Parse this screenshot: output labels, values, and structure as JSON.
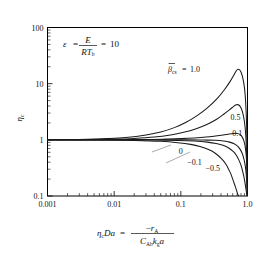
{
  "figure": {
    "annotation": {
      "epsilon_symbol": "ε",
      "equals": "=",
      "numerator": "E",
      "denominator_R": "R",
      "denominator_T": "T",
      "denominator_T_sub": "b",
      "value": "10",
      "full_text": "ε = E / (R T_b) = 10"
    },
    "ylabel": {
      "symbol": "η",
      "sub": "c"
    },
    "xlabel": {
      "lhs_eta": "η",
      "lhs_eta_sub": "c",
      "lhs_Da": "Da",
      "equals": "=",
      "numerator_minus": "−",
      "numerator_r": "r",
      "numerator_r_sub": "A",
      "den_C": "C",
      "den_C_sub": "Ab",
      "den_k": "k",
      "den_k_sub": "g",
      "den_a": "a",
      "full_text": "η_c Da = −r_A / (C_Ab k_g a)"
    },
    "legend_prefix": {
      "beta": "β",
      "sub": "cs",
      "equals": "="
    }
  },
  "chart_data": {
    "type": "line",
    "title": "",
    "xlabel": "η_c Da = −r_A / (C_Ab k_g a)",
    "ylabel": "η_c",
    "xscale": "log",
    "yscale": "log",
    "xlim": [
      0.001,
      1.0
    ],
    "ylim": [
      0.1,
      100
    ],
    "xticks": [
      0.001,
      0.01,
      0.1,
      1.0
    ],
    "xticklabels": [
      "0.001",
      "0.01",
      "0.1",
      "1.0"
    ],
    "yticks": [
      0.1,
      1,
      10,
      100
    ],
    "yticklabels": [
      "0.1",
      "1",
      "10",
      "100"
    ],
    "grid": false,
    "legend_position": "inline-curve-labels",
    "annotations": [
      {
        "text": "ε = E/(RT_b) = 10",
        "x": 0.008,
        "y": 38
      }
    ],
    "parameter_name": "β̄_cs",
    "series": [
      {
        "name": "1.0",
        "label": "β̄_cs = 1.0",
        "label_x": 0.12,
        "label_y": 13,
        "points": [
          [
            0.001,
            1.0
          ],
          [
            0.002,
            1.01
          ],
          [
            0.004,
            1.02
          ],
          [
            0.008,
            1.05
          ],
          [
            0.015,
            1.1
          ],
          [
            0.03,
            1.22
          ],
          [
            0.05,
            1.38
          ],
          [
            0.08,
            1.65
          ],
          [
            0.12,
            2.05
          ],
          [
            0.18,
            2.75
          ],
          [
            0.25,
            3.7
          ],
          [
            0.35,
            5.4
          ],
          [
            0.45,
            7.8
          ],
          [
            0.55,
            11.0
          ],
          [
            0.62,
            14.0
          ],
          [
            0.68,
            17.0
          ],
          [
            0.72,
            18.0
          ],
          [
            0.78,
            17.0
          ],
          [
            0.84,
            13.5
          ],
          [
            0.9,
            8.5
          ],
          [
            0.94,
            4.5
          ],
          [
            0.97,
            1.8
          ],
          [
            0.99,
            0.5
          ],
          [
            0.998,
            0.12
          ]
        ]
      },
      {
        "name": "0.5",
        "label": "0.5",
        "label_x": 0.66,
        "label_y": 2.6,
        "points": [
          [
            0.001,
            1.0
          ],
          [
            0.004,
            1.01
          ],
          [
            0.01,
            1.03
          ],
          [
            0.02,
            1.06
          ],
          [
            0.04,
            1.12
          ],
          [
            0.07,
            1.22
          ],
          [
            0.11,
            1.36
          ],
          [
            0.17,
            1.58
          ],
          [
            0.25,
            1.9
          ],
          [
            0.34,
            2.3
          ],
          [
            0.44,
            2.85
          ],
          [
            0.54,
            3.45
          ],
          [
            0.62,
            3.95
          ],
          [
            0.68,
            4.2
          ],
          [
            0.73,
            4.2
          ],
          [
            0.79,
            3.8
          ],
          [
            0.85,
            3.0
          ],
          [
            0.9,
            2.1
          ],
          [
            0.94,
            1.25
          ],
          [
            0.97,
            0.55
          ],
          [
            0.99,
            0.2
          ],
          [
            0.998,
            0.1
          ]
        ]
      },
      {
        "name": "0.1",
        "label": "0.1",
        "label_x": 0.7,
        "label_y": 1.3,
        "points": [
          [
            0.001,
            1.0
          ],
          [
            0.01,
            1.0
          ],
          [
            0.03,
            1.01
          ],
          [
            0.06,
            1.03
          ],
          [
            0.1,
            1.05
          ],
          [
            0.16,
            1.08
          ],
          [
            0.24,
            1.12
          ],
          [
            0.33,
            1.17
          ],
          [
            0.43,
            1.22
          ],
          [
            0.53,
            1.27
          ],
          [
            0.62,
            1.3
          ],
          [
            0.7,
            1.3
          ],
          [
            0.77,
            1.25
          ],
          [
            0.83,
            1.13
          ],
          [
            0.88,
            0.97
          ],
          [
            0.92,
            0.78
          ],
          [
            0.95,
            0.57
          ],
          [
            0.975,
            0.36
          ],
          [
            0.99,
            0.18
          ],
          [
            0.998,
            0.1
          ]
        ]
      },
      {
        "name": "0",
        "label": "0",
        "label_x": 0.1,
        "label_y": 0.62,
        "points": [
          [
            0.001,
            1.0
          ],
          [
            0.01,
            1.0
          ],
          [
            0.05,
            1.0
          ],
          [
            0.12,
            1.0
          ],
          [
            0.22,
            0.99
          ],
          [
            0.33,
            0.98
          ],
          [
            0.44,
            0.95
          ],
          [
            0.54,
            0.91
          ],
          [
            0.63,
            0.85
          ],
          [
            0.71,
            0.77
          ],
          [
            0.78,
            0.67
          ],
          [
            0.84,
            0.56
          ],
          [
            0.89,
            0.44
          ],
          [
            0.93,
            0.33
          ],
          [
            0.96,
            0.23
          ],
          [
            0.98,
            0.15
          ],
          [
            0.992,
            0.105
          ],
          [
            0.998,
            0.1
          ]
        ]
      },
      {
        "name": "-0.1",
        "label": "−0.1",
        "label_x": 0.16,
        "label_y": 0.4,
        "points": [
          [
            0.001,
            1.0
          ],
          [
            0.01,
            0.995
          ],
          [
            0.04,
            0.99
          ],
          [
            0.09,
            0.975
          ],
          [
            0.16,
            0.95
          ],
          [
            0.25,
            0.91
          ],
          [
            0.34,
            0.86
          ],
          [
            0.44,
            0.79
          ],
          [
            0.53,
            0.71
          ],
          [
            0.61,
            0.62
          ],
          [
            0.68,
            0.53
          ],
          [
            0.74,
            0.44
          ],
          [
            0.8,
            0.35
          ],
          [
            0.85,
            0.27
          ],
          [
            0.89,
            0.21
          ],
          [
            0.93,
            0.155
          ],
          [
            0.96,
            0.12
          ],
          [
            0.98,
            0.102
          ]
        ]
      },
      {
        "name": "-0.5",
        "label": "−0.5",
        "label_x": 0.3,
        "label_y": 0.31,
        "points": [
          [
            0.001,
            1.0
          ],
          [
            0.008,
            0.99
          ],
          [
            0.02,
            0.975
          ],
          [
            0.05,
            0.94
          ],
          [
            0.09,
            0.89
          ],
          [
            0.14,
            0.83
          ],
          [
            0.2,
            0.75
          ],
          [
            0.26,
            0.67
          ],
          [
            0.32,
            0.59
          ],
          [
            0.38,
            0.5
          ],
          [
            0.43,
            0.43
          ],
          [
            0.48,
            0.36
          ],
          [
            0.52,
            0.3
          ],
          [
            0.56,
            0.25
          ],
          [
            0.6,
            0.2
          ],
          [
            0.64,
            0.16
          ],
          [
            0.68,
            0.13
          ],
          [
            0.71,
            0.11
          ],
          [
            0.735,
            0.1
          ]
        ]
      }
    ]
  }
}
